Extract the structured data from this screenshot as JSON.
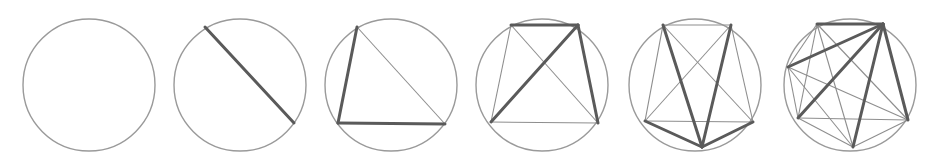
{
  "colors": {
    "circle": "#9a9a9a",
    "thin_chord": "#8e8e8e",
    "thick_chord": "#5a5a5a",
    "background": "#ffffff"
  },
  "diagrams": [
    {
      "points": 1,
      "chords": 0,
      "highlighted_chords": 0
    },
    {
      "points": 2,
      "chords": 1,
      "highlighted_chords": 1
    },
    {
      "points": 3,
      "chords": 3,
      "highlighted_chords": 2
    },
    {
      "points": 4,
      "chords": 6,
      "highlighted_chords": 3
    },
    {
      "points": 5,
      "chords": 10,
      "highlighted_chords": 4
    },
    {
      "points": 6,
      "chords": 15,
      "highlighted_chords": 5
    }
  ]
}
